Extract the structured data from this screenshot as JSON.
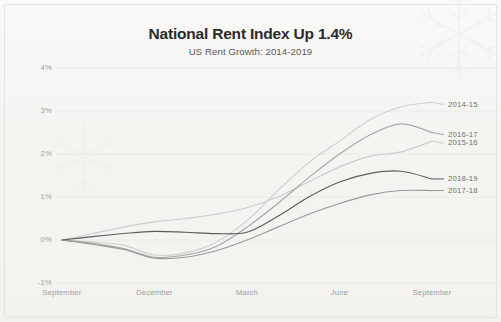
{
  "chart_data": {
    "type": "line",
    "title": "National Rent Index Up 1.4%",
    "subtitle": "US Rent Growth: 2014-2019",
    "xlabel": "",
    "ylabel": "",
    "x_tick_labels": [
      "September",
      "December",
      "March",
      "June",
      "September"
    ],
    "y_tick_labels": [
      "4%",
      "3%",
      "2%",
      "1%",
      "0%",
      "-1%"
    ],
    "y_tick_values": [
      4,
      3,
      2,
      1,
      0,
      -1
    ],
    "ylim": [
      -1,
      4
    ],
    "grid": true,
    "legend_position": "right-inline-labels",
    "x": [
      "September",
      "October",
      "November",
      "December",
      "January",
      "February",
      "March",
      "April",
      "May",
      "June",
      "July",
      "August",
      "September"
    ],
    "series": [
      {
        "name": "2014-15",
        "color": "#cfcfcf",
        "label_y_percent": 3.15,
        "values": [
          0.0,
          -0.05,
          -0.12,
          -0.35,
          -0.3,
          -0.05,
          0.45,
          1.15,
          1.8,
          2.3,
          2.8,
          3.1,
          3.2
        ]
      },
      {
        "name": "2015-16",
        "color": "#cbcbcb",
        "label_y_percent": 2.25,
        "values": [
          0.0,
          0.15,
          0.3,
          0.42,
          0.5,
          0.6,
          0.75,
          1.0,
          1.35,
          1.7,
          1.95,
          2.05,
          2.3
        ]
      },
      {
        "name": "2016-17",
        "color": "#a7a7a7",
        "label_y_percent": 2.45,
        "values": [
          0.0,
          -0.08,
          -0.2,
          -0.4,
          -0.35,
          -0.15,
          0.3,
          0.85,
          1.45,
          2.0,
          2.45,
          2.7,
          2.5
        ]
      },
      {
        "name": "2017-18",
        "color": "#9a9a9a",
        "label_y_percent": 1.15,
        "values": [
          0.0,
          -0.1,
          -0.22,
          -0.42,
          -0.4,
          -0.25,
          0.0,
          0.3,
          0.6,
          0.85,
          1.05,
          1.15,
          1.15
        ]
      },
      {
        "name": "2018-19",
        "color": "#5a5d60",
        "label_y_percent": 1.42,
        "values": [
          0.0,
          0.08,
          0.15,
          0.2,
          0.18,
          0.15,
          0.18,
          0.55,
          1.0,
          1.35,
          1.55,
          1.6,
          1.42
        ]
      }
    ]
  },
  "axis": {
    "y_ticks": [
      "4%",
      "3%",
      "2%",
      "1%",
      "0%",
      "-1%"
    ],
    "x_ticks": [
      "September",
      "December",
      "March",
      "June",
      "September"
    ]
  },
  "colors": {
    "background": "#f6f5f3",
    "title": "#2b2b2b",
    "subtitle": "#55585c",
    "tick": "#9a9ea3",
    "gridline": "#eceae6",
    "series_label": "#6d7175"
  }
}
